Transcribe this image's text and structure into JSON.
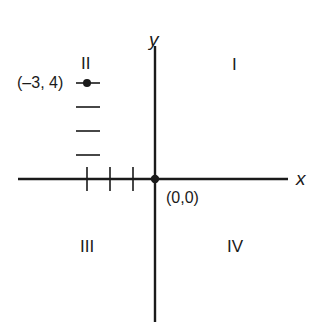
{
  "diagram": {
    "type": "coordinate-plane",
    "axes": {
      "x_label": "x",
      "y_label": "y"
    },
    "origin": {
      "label": "(0,0)"
    },
    "point": {
      "label": "(–3, 4)",
      "x": -3,
      "y": 4
    },
    "quadrants": {
      "q1": "I",
      "q2": "II",
      "q3": "III",
      "q4": "IV"
    },
    "colors": {
      "ink": "#1a1a1a",
      "background": "#ffffff"
    }
  }
}
